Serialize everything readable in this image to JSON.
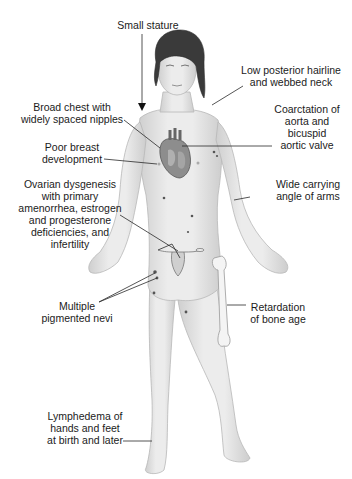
{
  "figure": {
    "labels": [
      {
        "id": "small-stature",
        "text": "Small stature"
      },
      {
        "id": "low-hairline",
        "text": "Low posterior hairline\nand webbed neck"
      },
      {
        "id": "broad-chest",
        "text": "Broad chest with\nwidely spaced nipples"
      },
      {
        "id": "coarctation",
        "text": "Coarctation of\naorta and\nbicuspid\naortic valve"
      },
      {
        "id": "poor-breast",
        "text": "Poor breast\ndevelopment"
      },
      {
        "id": "ovarian",
        "text": "Ovarian dysgenesis\nwith primary\namenorrhea, estrogen\nand progesterone\ndeficiencies, and\ninfertility"
      },
      {
        "id": "carrying-angle",
        "text": "Wide carrying\nangle of arms"
      },
      {
        "id": "nevi",
        "text": "Multiple\npigmented nevi"
      },
      {
        "id": "bone-age",
        "text": "Retardation\nof bone age"
      },
      {
        "id": "lymphedema",
        "text": "Lymphedema of\nhands and feet\nat birth and later"
      }
    ],
    "colors": {
      "background": "#ffffff",
      "text": "#1b1b1b",
      "leader_line": "#2a2a2a",
      "skin": "#e6e6e6",
      "skin_shadow": "#c9c9c9",
      "hair": "#3a3a3a",
      "heart": "#8a8a8a",
      "bone": "#f4f4f4"
    }
  }
}
